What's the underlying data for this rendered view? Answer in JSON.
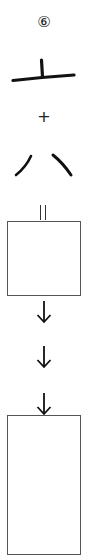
{
  "diagram": {
    "step_number": "⑥",
    "components": [
      {
        "id": "component-1",
        "glyph": "上-like stroke (horizontal base with short vertical)",
        "description": "radical: horizontal stroke with vertical stroke"
      },
      {
        "id": "component-2",
        "glyph": "八",
        "description": "two diverging strokes"
      }
    ],
    "operators": {
      "plus": "+",
      "equals": "="
    },
    "answer_boxes": [
      {
        "id": "answer-box-1",
        "value": ""
      },
      {
        "id": "answer-box-2",
        "value": ""
      }
    ],
    "arrows": [
      "down",
      "down",
      "down"
    ],
    "colors": {
      "ink": "#111111",
      "box_border": "#555555",
      "background": "#ffffff"
    }
  }
}
